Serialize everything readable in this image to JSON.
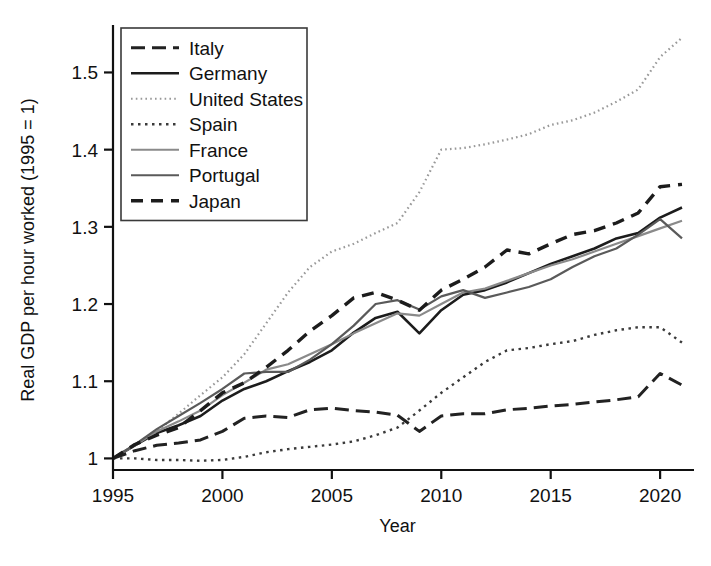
{
  "chart_data": {
    "type": "line",
    "title": "",
    "xlabel": "Year",
    "ylabel": "Real GDP per hour worked (1995 = 1)",
    "xlim": [
      1995,
      2021
    ],
    "ylim": [
      0.985,
      1.555
    ],
    "xticks": [
      1995,
      2000,
      2005,
      2010,
      2015,
      2020
    ],
    "xtick_labels": [
      "1995",
      "2000",
      "2005",
      "2010",
      "2015",
      "2020"
    ],
    "yticks": [
      1,
      1.1,
      1.2,
      1.3,
      1.4,
      1.5
    ],
    "ytick_labels": [
      "1",
      "1.1",
      "1.2",
      "1.3",
      "1.4",
      "1.5"
    ],
    "grid": false,
    "legend_position": "top-left",
    "x": [
      1995,
      1996,
      1997,
      1998,
      1999,
      2000,
      2001,
      2002,
      2003,
      2004,
      2005,
      2006,
      2007,
      2008,
      2009,
      2010,
      2011,
      2012,
      2013,
      2014,
      2015,
      2016,
      2017,
      2018,
      2019,
      2020,
      2021
    ],
    "series": [
      {
        "name": "Italy",
        "style": "long-dash",
        "color": "#222222",
        "width": 3.0,
        "dash": "14,7",
        "values": [
          1.0,
          1.01,
          1.017,
          1.02,
          1.024,
          1.035,
          1.052,
          1.055,
          1.053,
          1.063,
          1.065,
          1.062,
          1.06,
          1.056,
          1.035,
          1.055,
          1.058,
          1.058,
          1.063,
          1.065,
          1.068,
          1.07,
          1.073,
          1.076,
          1.08,
          1.11,
          1.095
        ]
      },
      {
        "name": "Germany",
        "style": "solid",
        "color": "#1c1c1c",
        "width": 2.6,
        "dash": "none",
        "values": [
          1.0,
          1.017,
          1.033,
          1.043,
          1.055,
          1.075,
          1.09,
          1.1,
          1.113,
          1.125,
          1.14,
          1.163,
          1.182,
          1.19,
          1.162,
          1.192,
          1.212,
          1.218,
          1.228,
          1.24,
          1.252,
          1.262,
          1.272,
          1.285,
          1.292,
          1.312,
          1.325
        ]
      },
      {
        "name": "United States",
        "style": "fine-dot",
        "color": "#999999",
        "width": 2.2,
        "dash": "1.6,3.2",
        "values": [
          1.0,
          1.018,
          1.035,
          1.058,
          1.082,
          1.105,
          1.135,
          1.175,
          1.215,
          1.248,
          1.268,
          1.278,
          1.292,
          1.305,
          1.345,
          1.4,
          1.402,
          1.407,
          1.413,
          1.42,
          1.432,
          1.438,
          1.448,
          1.462,
          1.478,
          1.52,
          1.545
        ]
      },
      {
        "name": "Spain",
        "style": "dot",
        "color": "#3a3a3a",
        "width": 2.4,
        "dash": "2.5,4.5",
        "values": [
          1.0,
          1.0,
          0.998,
          0.998,
          0.997,
          0.998,
          1.002,
          1.008,
          1.012,
          1.015,
          1.018,
          1.022,
          1.03,
          1.04,
          1.062,
          1.085,
          1.105,
          1.125,
          1.14,
          1.143,
          1.148,
          1.152,
          1.16,
          1.166,
          1.17,
          1.17,
          1.15
        ]
      },
      {
        "name": "France",
        "style": "solid-light",
        "color": "#8a8a8a",
        "width": 2.2,
        "dash": "none",
        "values": [
          1.0,
          1.017,
          1.035,
          1.048,
          1.062,
          1.082,
          1.098,
          1.115,
          1.122,
          1.135,
          1.148,
          1.162,
          1.175,
          1.188,
          1.185,
          1.2,
          1.215,
          1.22,
          1.23,
          1.24,
          1.25,
          1.258,
          1.268,
          1.278,
          1.288,
          1.298,
          1.308
        ]
      },
      {
        "name": "Portugal",
        "style": "solid-gray",
        "color": "#5a5a5a",
        "width": 2.2,
        "dash": "none",
        "values": [
          1.0,
          1.018,
          1.038,
          1.055,
          1.072,
          1.09,
          1.11,
          1.112,
          1.112,
          1.128,
          1.148,
          1.172,
          1.2,
          1.205,
          1.193,
          1.21,
          1.218,
          1.208,
          1.215,
          1.222,
          1.232,
          1.248,
          1.262,
          1.272,
          1.29,
          1.31,
          1.285
        ]
      },
      {
        "name": "Japan",
        "style": "dash",
        "color": "#1c1c1c",
        "width": 3.4,
        "dash": "12,8",
        "values": [
          1.0,
          1.018,
          1.03,
          1.04,
          1.062,
          1.085,
          1.098,
          1.118,
          1.14,
          1.165,
          1.185,
          1.208,
          1.215,
          1.205,
          1.192,
          1.218,
          1.232,
          1.248,
          1.27,
          1.265,
          1.278,
          1.29,
          1.295,
          1.305,
          1.318,
          1.352,
          1.355
        ]
      }
    ]
  },
  "legend": {
    "items": [
      {
        "label": "Italy"
      },
      {
        "label": "Germany"
      },
      {
        "label": "United States"
      },
      {
        "label": "Spain"
      },
      {
        "label": "France"
      },
      {
        "label": "Portugal"
      },
      {
        "label": "Japan"
      }
    ]
  },
  "axes": {
    "x_title": "Year",
    "y_title": "Real GDP per hour worked (1995 = 1)"
  }
}
